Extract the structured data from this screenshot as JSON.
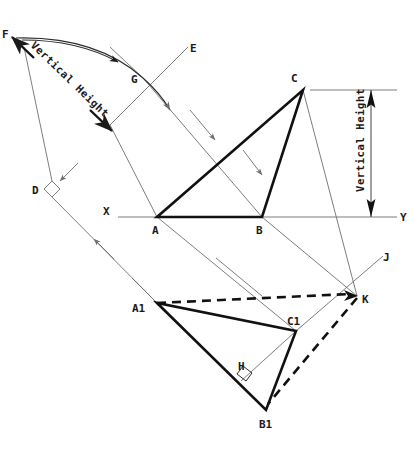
{
  "figure": {
    "title": "",
    "background_color": "#ffffff",
    "line_color": "#2b2b2b",
    "thin_line_color": "#6e6e6e",
    "annotations": {
      "vertical_height_left": "Vertical Height",
      "vertical_height_right": "Vertical Height"
    },
    "points": [
      {
        "id": "F",
        "label": "F",
        "x": 8,
        "y": 33,
        "label_x": 2,
        "label_y": 38
      },
      {
        "id": "E",
        "label": "E",
        "x": 188,
        "y": 47,
        "label_x": 190,
        "label_y": 52
      },
      {
        "id": "G",
        "label": "G",
        "x": 143,
        "y": 78,
        "label_x": 132,
        "label_y": 83
      },
      {
        "id": "C",
        "label": "C",
        "x": 303,
        "y": 90,
        "label_x": 292,
        "label_y": 82
      },
      {
        "id": "D",
        "label": "D",
        "x": 52,
        "y": 189,
        "label_x": 33,
        "label_y": 193
      },
      {
        "id": "X",
        "label": "X",
        "x": 118,
        "y": 217,
        "label_x": 105,
        "label_y": 214
      },
      {
        "id": "Y",
        "label": "Y",
        "x": 397,
        "y": 217,
        "label_x": 400,
        "label_y": 221
      },
      {
        "id": "A",
        "label": "A",
        "x": 157,
        "y": 217,
        "label_x": 152,
        "label_y": 233
      },
      {
        "id": "B",
        "label": "B",
        "x": 262,
        "y": 217,
        "label_x": 256,
        "label_y": 233
      },
      {
        "id": "J",
        "label": "J",
        "x": 383,
        "y": 256,
        "label_x": 384,
        "label_y": 261
      },
      {
        "id": "K",
        "label": "K",
        "x": 357,
        "y": 296,
        "label_x": 361,
        "label_y": 302
      },
      {
        "id": "A1",
        "label": "A1",
        "x": 157,
        "y": 303,
        "label_x": 133,
        "label_y": 308
      },
      {
        "id": "C1",
        "label": "C1",
        "x": 296,
        "y": 331,
        "label_x": 288,
        "label_y": 323
      },
      {
        "id": "H",
        "label": "H",
        "x": 250,
        "y": 372,
        "label_x": 240,
        "label_y": 369
      },
      {
        "id": "B1",
        "label": "B1",
        "x": 266,
        "y": 410,
        "label_x": 261,
        "label_y": 427
      }
    ],
    "shapes": {
      "triangle_top": {
        "name": "ABC",
        "vertices": [
          "A",
          "B",
          "C"
        ],
        "style": "solid-thick"
      },
      "triangle_bottom": {
        "name": "A1B1C1",
        "vertices": [
          "A1",
          "B1",
          "C1"
        ],
        "style": "solid-thick"
      },
      "dashed_path": {
        "name": "A1-K-B1",
        "vertices": [
          "A1",
          "K",
          "B1"
        ],
        "style": "dashed-thick"
      },
      "ground_line": {
        "name": "XY",
        "from": "X",
        "to": "Y",
        "style": "thin"
      },
      "altitude": {
        "name": "A1-H-C1",
        "from": "A1",
        "to": "C1",
        "through": "H",
        "style": "thin"
      }
    },
    "right_angles": [
      {
        "at": "D",
        "size": 9
      },
      {
        "at": "H",
        "size": 9
      }
    ],
    "dimension_line": {
      "label": "Vertical Height",
      "top_y": 90,
      "bottom_y": 217,
      "x": 371,
      "tick_left_top": 310,
      "tick_right_top": 397
    }
  }
}
